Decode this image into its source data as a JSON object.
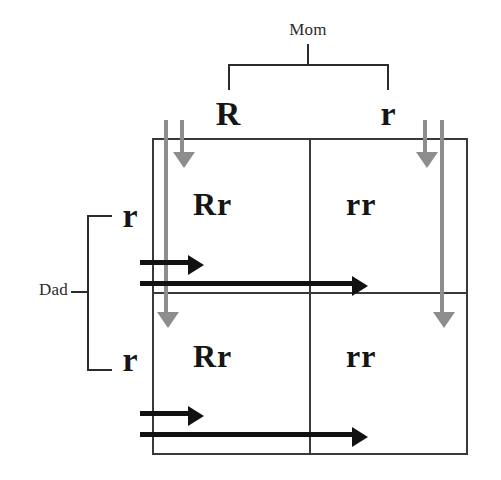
{
  "diagram": {
    "type": "punnett-square",
    "parents": {
      "mom": {
        "label": "Mom",
        "alleles": [
          "R",
          "r"
        ]
      },
      "dad": {
        "label": "Dad",
        "alleles": [
          "r",
          "r"
        ]
      }
    },
    "grid": {
      "columns": [
        "R",
        "r"
      ],
      "rows": [
        "r",
        "r"
      ],
      "cells": [
        [
          "Rr",
          "rr"
        ],
        [
          "Rr",
          "rr"
        ]
      ]
    },
    "arrows": {
      "mom_vertical_color": "#8d8d8d",
      "dad_horizontal_color": "#111111",
      "mom_count": 4,
      "dad_count": 4
    },
    "colors": {
      "background": "#ffffff",
      "grid_line": "#3a3a3a",
      "text": "#151515",
      "label": "#2b2b2b"
    }
  }
}
